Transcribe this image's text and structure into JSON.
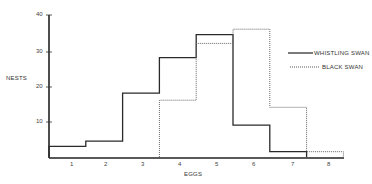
{
  "chart_data": {
    "type": "line",
    "subtype": "step-histogram",
    "title": "",
    "xlabel": "EGGS",
    "ylabel": "NESTS",
    "categories": [
      1,
      2,
      3,
      4,
      5,
      6,
      7,
      8
    ],
    "series": [
      {
        "name": "WHISTLING SWAN",
        "style": "solid",
        "values": [
          3,
          4.5,
          18,
          28,
          34.5,
          9,
          1.5,
          0
        ]
      },
      {
        "name": "BLACK SWAN",
        "style": "dotted",
        "values": [
          0,
          0,
          0,
          16,
          32,
          36,
          14,
          1.5
        ]
      }
    ],
    "ylim": [
      0,
      40
    ],
    "yticks": [
      10,
      20,
      30,
      40
    ],
    "xticks": [
      "1",
      "2",
      "3",
      "4",
      "5",
      "6",
      "7",
      "8"
    ],
    "grid": false,
    "legend_position": "right"
  },
  "axis": {
    "y_label": "NESTS",
    "x_label": "EGGS",
    "y_ticks": [
      "40",
      "30",
      "20",
      "10"
    ],
    "x_ticks": [
      "1",
      "2",
      "3",
      "4",
      "5",
      "6",
      "7",
      "8"
    ]
  },
  "legend": {
    "whistling": "WHISTLING SWAN",
    "black": "BLACK SWAN"
  }
}
